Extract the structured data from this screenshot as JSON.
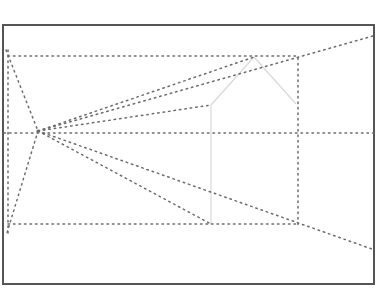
{
  "diagram": {
    "title": "",
    "colors": {
      "background": "#ffffff",
      "frame": "#555555",
      "dotted": "#6b6b6b",
      "light_solid": "#d8d8d8"
    },
    "frame": {
      "x1": 3,
      "y1": 25,
      "x2": 374,
      "y2": 284
    },
    "vanishing_point": {
      "x": 38,
      "y": 131
    },
    "dotted_lines": [
      {
        "name": "top-horizontal",
        "x1": 8,
        "y1": 56,
        "x2": 298,
        "y2": 56
      },
      {
        "name": "middle-horizontal",
        "x1": 4,
        "y1": 133,
        "x2": 374,
        "y2": 133
      },
      {
        "name": "bottom-horizontal",
        "x1": 8,
        "y1": 224,
        "x2": 298,
        "y2": 224
      },
      {
        "name": "left-vertical",
        "x1": 8,
        "y1": 50,
        "x2": 8,
        "y2": 236
      },
      {
        "name": "right-vertical",
        "x1": 298,
        "y1": 58,
        "x2": 298,
        "y2": 226
      },
      {
        "name": "top-left-to-vp",
        "x1": 6,
        "y1": 50,
        "x2": 38,
        "y2": 131
      },
      {
        "name": "vp-to-bottom-left",
        "x1": 38,
        "y1": 131,
        "x2": 6,
        "y2": 236
      },
      {
        "name": "vp-to-apex",
        "x1": 38,
        "y1": 131,
        "x2": 254,
        "y2": 57
      },
      {
        "name": "vp-to-top-right",
        "x1": 38,
        "y1": 131,
        "x2": 373,
        "y2": 36
      },
      {
        "name": "vp-to-eave-left",
        "x1": 38,
        "y1": 131,
        "x2": 211,
        "y2": 105
      },
      {
        "name": "vp-to-base-left",
        "x1": 38,
        "y1": 131,
        "x2": 211,
        "y2": 224
      },
      {
        "name": "vp-to-bottom-right",
        "x1": 38,
        "y1": 131,
        "x2": 372,
        "y2": 249
      }
    ],
    "light_solid_lines": [
      {
        "name": "roof-left",
        "x1": 254,
        "y1": 57,
        "x2": 211,
        "y2": 105
      },
      {
        "name": "roof-right",
        "x1": 254,
        "y1": 57,
        "x2": 296,
        "y2": 104
      },
      {
        "name": "wall-left",
        "x1": 211,
        "y1": 105,
        "x2": 211,
        "y2": 224
      }
    ]
  }
}
